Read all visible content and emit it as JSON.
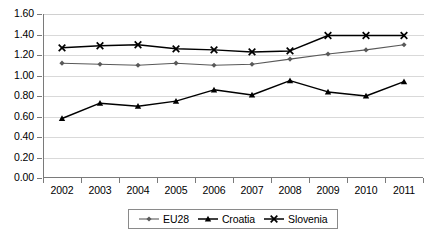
{
  "chart_data": {
    "type": "line",
    "title": "",
    "subtitle": "",
    "xlabel": "",
    "ylabel": "",
    "categories": [
      "2002",
      "2003",
      "2004",
      "2005",
      "2006",
      "2007",
      "2008",
      "2009",
      "2010",
      "2011"
    ],
    "ylim": [
      0.0,
      1.6
    ],
    "ytick_step": 0.2,
    "yticks": [
      "0.00",
      "0.20",
      "0.40",
      "0.60",
      "0.80",
      "1.00",
      "1.20",
      "1.40",
      "1.60"
    ],
    "grid": true,
    "grid_axis": "y",
    "legend_position": "bottom",
    "series": [
      {
        "name": "EU28",
        "marker": "diamond",
        "color": "#595959",
        "values": [
          1.12,
          1.11,
          1.1,
          1.12,
          1.1,
          1.11,
          1.16,
          1.21,
          1.25,
          1.3
        ]
      },
      {
        "name": "Croatia",
        "marker": "triangle",
        "color": "#000000",
        "values": [
          0.58,
          0.73,
          0.7,
          0.75,
          0.86,
          0.81,
          0.95,
          0.84,
          0.8,
          0.94
        ]
      },
      {
        "name": "Slovenia",
        "marker": "x",
        "color": "#000000",
        "values": [
          1.27,
          1.29,
          1.3,
          1.26,
          1.25,
          1.23,
          1.24,
          1.39,
          1.39,
          1.39
        ]
      }
    ]
  },
  "legend": {
    "items": [
      {
        "label": "EU28",
        "marker": "diamond"
      },
      {
        "label": "Croatia",
        "marker": "triangle"
      },
      {
        "label": "Slovenia",
        "marker": "x"
      }
    ]
  },
  "colors": {
    "eu28": "#595959",
    "croatia": "#000000",
    "slovenia": "#000000",
    "grid": "#d9d9d9",
    "axis": "#7a7a7a",
    "background": "#ffffff"
  }
}
